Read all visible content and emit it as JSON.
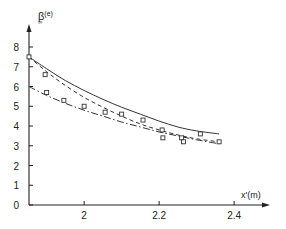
{
  "chart_data": {
    "type": "line",
    "title": "",
    "xlabel": "x'(m)",
    "ylabel": "β∞(e)",
    "ylabel_main": "β",
    "ylabel_sub": "∞",
    "ylabel_sup": "(e)",
    "xlim": [
      1.853,
      2.5
    ],
    "ylim": [
      0,
      8.9
    ],
    "x_ticks": [
      {
        "value": 2.0,
        "label": "2"
      },
      {
        "value": 2.2,
        "label": "2.2"
      },
      {
        "value": 2.4,
        "label": "2.4"
      }
    ],
    "y_ticks": [
      {
        "value": 0,
        "label": "0"
      },
      {
        "value": 1,
        "label": "1"
      },
      {
        "value": 2,
        "label": "2"
      },
      {
        "value": 3,
        "label": "3"
      },
      {
        "value": 4,
        "label": "4"
      },
      {
        "value": 5,
        "label": "5"
      },
      {
        "value": 6,
        "label": "6"
      },
      {
        "value": 7,
        "label": "7"
      },
      {
        "value": 8,
        "label": "8"
      }
    ],
    "grid": false,
    "legend": null,
    "series": [
      {
        "name": "solid curve",
        "style": "solid",
        "x": [
          1.853,
          1.9,
          1.95,
          2.0,
          2.05,
          2.1,
          2.15,
          2.2,
          2.25,
          2.3,
          2.36
        ],
        "values": [
          7.5,
          6.9,
          6.3,
          5.8,
          5.35,
          4.95,
          4.6,
          4.25,
          3.95,
          3.75,
          3.6
        ]
      },
      {
        "name": "dashed curve",
        "style": "dashed",
        "x": [
          1.853,
          1.9,
          1.95,
          2.0,
          2.05,
          2.1,
          2.15,
          2.2,
          2.25,
          2.3,
          2.36
        ],
        "values": [
          7.5,
          6.75,
          6.05,
          5.45,
          4.95,
          4.5,
          4.1,
          3.8,
          3.55,
          3.35,
          3.2
        ]
      },
      {
        "name": "dash-dot curve",
        "style": "dashdot",
        "x": [
          1.853,
          1.9,
          1.95,
          2.0,
          2.05,
          2.1,
          2.15,
          2.2,
          2.25,
          2.3,
          2.36
        ],
        "values": [
          6.0,
          5.55,
          5.15,
          4.8,
          4.5,
          4.2,
          3.95,
          3.7,
          3.5,
          3.3,
          3.1
        ]
      },
      {
        "name": "measured points",
        "style": "markers-square",
        "x": [
          1.853,
          1.896,
          1.9,
          1.946,
          2.0,
          2.056,
          2.1,
          2.157,
          2.208,
          2.21,
          2.26,
          2.265,
          2.31,
          2.36
        ],
        "values": [
          7.5,
          6.6,
          5.7,
          5.3,
          5.0,
          4.7,
          4.6,
          4.3,
          3.8,
          3.4,
          3.4,
          3.2,
          3.6,
          3.2
        ]
      }
    ]
  }
}
